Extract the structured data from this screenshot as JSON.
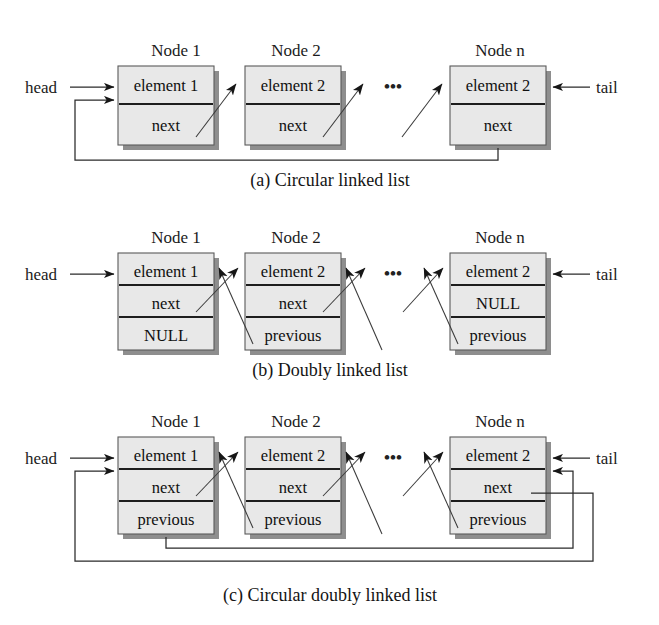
{
  "figure": {
    "background_color": "#ffffff",
    "box_fill_color": "#e8e8e8",
    "box_shadow_color": "#8e8e8e",
    "line_color": "#2a2a2a",
    "text_color": "#141414"
  },
  "labels": {
    "head": "head",
    "tail": "tail",
    "ellipsis": "•••"
  },
  "diagrams": [
    {
      "id": "circular-linked-list",
      "caption": "(a) Circular linked list",
      "nodes": [
        {
          "title": "Node 1",
          "fields": [
            "element 1",
            "next"
          ]
        },
        {
          "title": "Node 2",
          "fields": [
            "element 2",
            "next"
          ]
        },
        {
          "title": "Node n",
          "fields": [
            "element 2",
            "next"
          ]
        }
      ]
    },
    {
      "id": "doubly-linked-list",
      "caption": "(b) Doubly linked list",
      "nodes": [
        {
          "title": "Node 1",
          "fields": [
            "element 1",
            "next",
            "NULL"
          ]
        },
        {
          "title": "Node 2",
          "fields": [
            "element 2",
            "next",
            "previous"
          ]
        },
        {
          "title": "Node n",
          "fields": [
            "element 2",
            "NULL",
            "previous"
          ]
        }
      ]
    },
    {
      "id": "circular-doubly-linked-list",
      "caption": "(c) Circular doubly linked list",
      "nodes": [
        {
          "title": "Node 1",
          "fields": [
            "element 1",
            "next",
            "previous"
          ]
        },
        {
          "title": "Node 2",
          "fields": [
            "element 2",
            "next",
            "previous"
          ]
        },
        {
          "title": "Node n",
          "fields": [
            "element 2",
            "next",
            "previous"
          ]
        }
      ]
    }
  ]
}
